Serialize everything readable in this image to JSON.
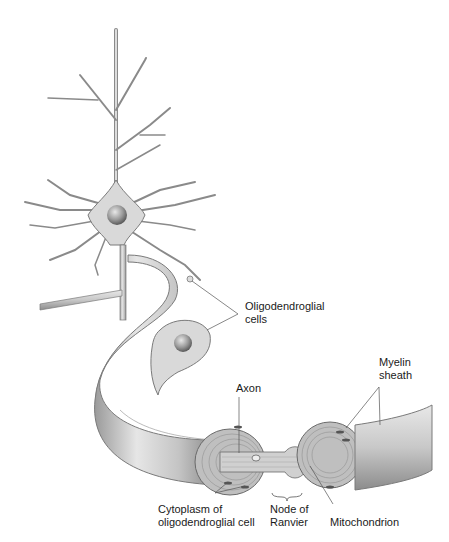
{
  "figure": {
    "labels": {
      "oligodendroglial_cells": [
        "Oligodendroglial",
        "cells"
      ],
      "myelin_sheath": [
        "Myelin",
        "sheath"
      ],
      "axon": "Axon",
      "cytoplasm": [
        "Cytoplasm of",
        "oligodendroglial cell"
      ],
      "node_of_ranvier": [
        "Node of",
        "Ranvier"
      ],
      "mitochondrion": "Mitochondrion"
    },
    "colors": {
      "cell_fill": "#d9d9d9",
      "cell_stroke": "#7a7a7a",
      "sheath_fill": "#c8c8c8",
      "nucleus": "#8c8c8c",
      "text": "#1a1a1a"
    }
  }
}
